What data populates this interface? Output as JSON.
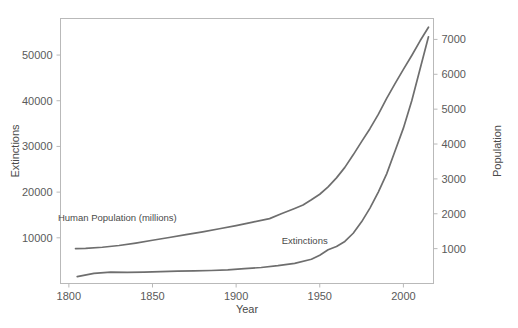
{
  "chart_data": {
    "type": "line",
    "title": "",
    "xlabel": "Year",
    "ylabel": "Extinctions",
    "y2label": "Population",
    "xlim": [
      1795,
      2018
    ],
    "ylim": [
      0,
      58000
    ],
    "y2lim": [
      0,
      7600
    ],
    "grid": false,
    "legend_position": "inline-annotations",
    "xticks": [
      "1800",
      "1850",
      "1900",
      "1950",
      "2000"
    ],
    "xtick_values": [
      1800,
      1850,
      1900,
      1950,
      2000
    ],
    "yticks": [
      "10000",
      "20000",
      "30000",
      "40000",
      "50000"
    ],
    "ytick_values": [
      10000,
      20000,
      30000,
      40000,
      50000
    ],
    "y2ticks": [
      "1000",
      "2000",
      "3000",
      "4000",
      "5000",
      "6000",
      "7000"
    ],
    "y2tick_values": [
      1000,
      2000,
      3000,
      4000,
      5000,
      6000,
      7000
    ],
    "series": [
      {
        "name": "Human Population (millions)",
        "axis": "right",
        "color": "#6e6e6e",
        "annotation": "Human Population (millions)",
        "annotation_x": 1829,
        "annotation_y": 1790,
        "x": [
          1804,
          1810,
          1820,
          1830,
          1840,
          1850,
          1860,
          1870,
          1880,
          1890,
          1900,
          1910,
          1920,
          1927,
          1935,
          1940,
          1945,
          1950,
          1955,
          1960,
          1965,
          1970,
          1975,
          1980,
          1985,
          1990,
          1995,
          2000,
          2005,
          2010,
          2015
        ],
        "y": [
          1000,
          1010,
          1040,
          1090,
          1160,
          1240,
          1320,
          1400,
          1480,
          1570,
          1660,
          1760,
          1860,
          2000,
          2150,
          2250,
          2400,
          2560,
          2770,
          3030,
          3330,
          3690,
          4070,
          4440,
          4850,
          5310,
          5730,
          6140,
          6540,
          6960,
          7350
        ]
      },
      {
        "name": "Extinctions",
        "axis": "left",
        "color": "#6e6e6e",
        "annotation": "Extinctions",
        "annotation_x": 1941,
        "annotation_y": 8600,
        "x": [
          1805,
          1815,
          1825,
          1835,
          1845,
          1855,
          1865,
          1875,
          1885,
          1895,
          1905,
          1915,
          1925,
          1935,
          1945,
          1950,
          1955,
          1960,
          1965,
          1970,
          1975,
          1980,
          1985,
          1990,
          1995,
          2000,
          2005,
          2010,
          2015
        ],
        "y": [
          1500,
          2200,
          2500,
          2450,
          2500,
          2600,
          2700,
          2750,
          2850,
          3000,
          3250,
          3500,
          3900,
          4400,
          5300,
          6200,
          7400,
          8100,
          9200,
          11000,
          13500,
          16500,
          20000,
          24000,
          29000,
          34000,
          40000,
          47000,
          54000
        ]
      }
    ]
  },
  "axes": {
    "x_title": "Year",
    "y_left_title": "Extinctions",
    "y_right_title": "Population"
  }
}
